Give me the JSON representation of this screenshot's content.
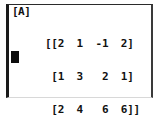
{
  "device": {
    "type": "graphing-calculator-screen",
    "background_color": "#ffffff",
    "text_color": "#111111",
    "border_color": "#1a1a1a"
  },
  "screen": {
    "matrix_name": "[A]",
    "cursor": {
      "visible": true,
      "glyph": "block",
      "color": "#0d0d0d"
    },
    "matrix": {
      "rows": 3,
      "cols": 4,
      "values": [
        [
          2,
          1,
          -1,
          2
        ],
        [
          1,
          3,
          2,
          1
        ],
        [
          2,
          4,
          6,
          6
        ]
      ],
      "rendered_lines": [
        "[[2  1  -1  2]",
        " [1  3   2  1]",
        " [2  4   6  6]]"
      ],
      "line_1": "[[2  1  -1  2]",
      "line_2": " [1  3   2  1]",
      "line_3": " [2  4   6  6]]"
    }
  }
}
